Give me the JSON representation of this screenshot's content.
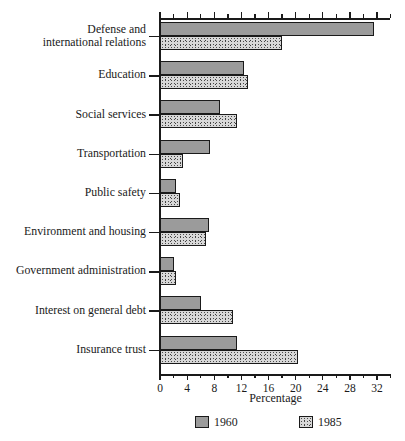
{
  "chart_data": {
    "type": "bar",
    "orientation": "horizontal",
    "title": "",
    "xlabel": "Percentage",
    "ylabel": "",
    "xlim": [
      0,
      34
    ],
    "xticks": [
      0,
      4,
      8,
      12,
      16,
      20,
      24,
      28,
      32
    ],
    "xtick_labels": [
      "0",
      "4",
      "8",
      "12",
      "16",
      "20",
      "24",
      "28",
      "32"
    ],
    "minor_tick_step": 2,
    "grid": false,
    "legend_position": "bottom",
    "categories": [
      "Defense and\ninternational relations",
      "Education",
      "Social services",
      "Transportation",
      "Public safety",
      "Environment and housing",
      "Government administration",
      "Interest on general debt",
      "Insurance trust"
    ],
    "series": [
      {
        "name": "1960",
        "fill": "solid-gray",
        "color": "#9b9b9b",
        "values": [
          31.5,
          12.4,
          8.9,
          7.3,
          2.3,
          7.2,
          2.1,
          6.0,
          11.4
        ]
      },
      {
        "name": "1985",
        "fill": "stippled",
        "color": "#d8d8d8",
        "values": [
          18.0,
          13.0,
          11.4,
          3.4,
          3.0,
          6.8,
          2.4,
          10.8,
          20.3
        ]
      }
    ]
  },
  "axis": {
    "x_title": "Percentage"
  },
  "legend": {
    "items": [
      {
        "label": "1960"
      },
      {
        "label": "1985"
      }
    ]
  }
}
